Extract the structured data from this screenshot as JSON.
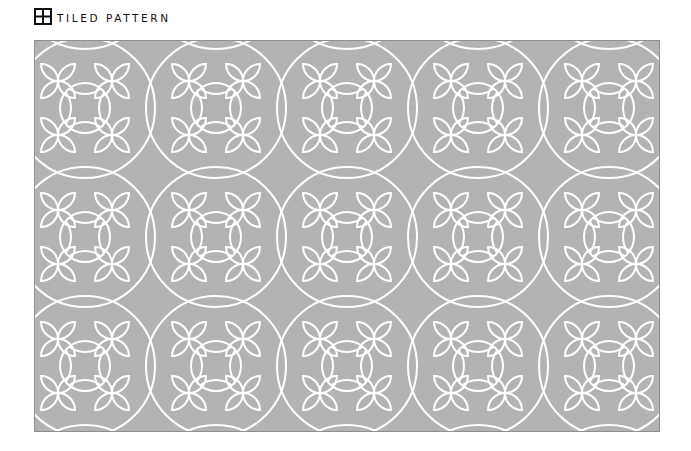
{
  "header": {
    "icon": "grid-2x2-icon",
    "title": "TILED PATTERN"
  },
  "pattern": {
    "background_color": "#b3b3b3",
    "line_color": "#ffffff",
    "border_color": "#8f8f8f",
    "columns": 5,
    "rows": 3,
    "tile_period_x": 131,
    "tile_period_y": 129
  }
}
